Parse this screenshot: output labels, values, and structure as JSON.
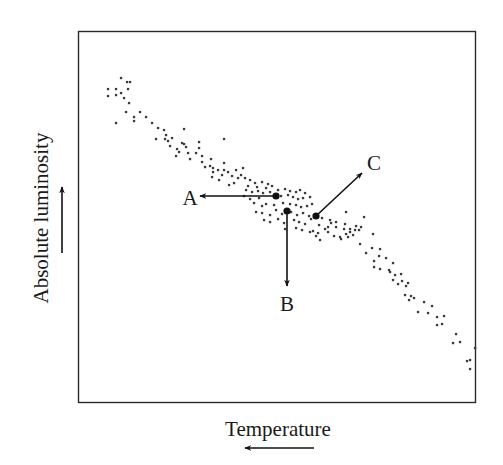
{
  "chart_data": {
    "type": "scatter",
    "title": "",
    "xlabel": "Temperature",
    "ylabel": "Absolute luminosity",
    "x_axis_direction": "decreasing to the right (arrow points left = increasing temperature)",
    "y_axis_direction": "increasing upward",
    "grid": false,
    "legend": null,
    "ticks": {
      "x": [],
      "y": []
    },
    "frame": {
      "left": 78,
      "top": 31,
      "right": 476,
      "bottom": 403
    },
    "colors": {
      "points": "#3a3a3a",
      "frame": "#2a2a2a",
      "arrows": "#111111",
      "text": "#1a1a1a"
    },
    "annotations": [
      {
        "label": "A",
        "from": [
          276,
          196
        ],
        "to": [
          200,
          196
        ],
        "label_pos": [
          190,
          205
        ],
        "direction": "left"
      },
      {
        "label": "B",
        "from": [
          287,
          211
        ],
        "to": [
          287,
          286
        ],
        "label_pos": [
          287,
          311
        ],
        "direction": "down"
      },
      {
        "label": "C",
        "from": [
          316,
          216
        ],
        "to": [
          362,
          173
        ],
        "label_pos": [
          374,
          170
        ],
        "direction": "up-right"
      }
    ],
    "points": [
      [
        121,
        78
      ],
      [
        127,
        82
      ],
      [
        130,
        82
      ],
      [
        108,
        89
      ],
      [
        116,
        89
      ],
      [
        128,
        89
      ],
      [
        108,
        96
      ],
      [
        116,
        95
      ],
      [
        121,
        93
      ],
      [
        124,
        98
      ],
      [
        129,
        103
      ],
      [
        126,
        112
      ],
      [
        140,
        112
      ],
      [
        134,
        117
      ],
      [
        134,
        121
      ],
      [
        146,
        117
      ],
      [
        116,
        123
      ],
      [
        152,
        123
      ],
      [
        158,
        128
      ],
      [
        164,
        130
      ],
      [
        166,
        135
      ],
      [
        165,
        139
      ],
      [
        156,
        139
      ],
      [
        184,
        129
      ],
      [
        170,
        146
      ],
      [
        168,
        141
      ],
      [
        172,
        138
      ],
      [
        177,
        149
      ],
      [
        182,
        143
      ],
      [
        179,
        152
      ],
      [
        184,
        144
      ],
      [
        176,
        156
      ],
      [
        186,
        147
      ],
      [
        188,
        153
      ],
      [
        199,
        142
      ],
      [
        190,
        159
      ],
      [
        202,
        156
      ],
      [
        199,
        148
      ],
      [
        202,
        162
      ],
      [
        196,
        153
      ],
      [
        211,
        159
      ],
      [
        210,
        166
      ],
      [
        213,
        172
      ],
      [
        218,
        170
      ],
      [
        224,
        163
      ],
      [
        213,
        168
      ],
      [
        212,
        177
      ],
      [
        222,
        175
      ],
      [
        224,
        170
      ],
      [
        224,
        139
      ],
      [
        205,
        167
      ],
      [
        219,
        180
      ],
      [
        228,
        172
      ],
      [
        232,
        176
      ],
      [
        236,
        170
      ],
      [
        238,
        178
      ],
      [
        234,
        183
      ],
      [
        229,
        185
      ],
      [
        241,
        175
      ],
      [
        243,
        168
      ],
      [
        245,
        178
      ],
      [
        250,
        180
      ],
      [
        255,
        183
      ],
      [
        262,
        182
      ],
      [
        268,
        184
      ],
      [
        272,
        186
      ],
      [
        278,
        190
      ],
      [
        285,
        189
      ],
      [
        290,
        191
      ],
      [
        296,
        192
      ],
      [
        300,
        190
      ],
      [
        305,
        193
      ],
      [
        246,
        190
      ],
      [
        252,
        192
      ],
      [
        258,
        191
      ],
      [
        263,
        193
      ],
      [
        270,
        192
      ],
      [
        281,
        196
      ],
      [
        288,
        195
      ],
      [
        293,
        197
      ],
      [
        298,
        199
      ],
      [
        303,
        198
      ],
      [
        310,
        197
      ],
      [
        254,
        203
      ],
      [
        262,
        206
      ],
      [
        266,
        204
      ],
      [
        274,
        205
      ],
      [
        283,
        203
      ],
      [
        290,
        204
      ],
      [
        296,
        205
      ],
      [
        301,
        207
      ],
      [
        307,
        206
      ],
      [
        312,
        204
      ],
      [
        256,
        212
      ],
      [
        262,
        213
      ],
      [
        270,
        215
      ],
      [
        276,
        210
      ],
      [
        282,
        214
      ],
      [
        291,
        212
      ],
      [
        297,
        215
      ],
      [
        303,
        213
      ],
      [
        309,
        216
      ],
      [
        264,
        220
      ],
      [
        270,
        222
      ],
      [
        278,
        219
      ],
      [
        284,
        223
      ],
      [
        294,
        220
      ],
      [
        299,
        222
      ],
      [
        305,
        224
      ],
      [
        311,
        219
      ],
      [
        285,
        229
      ],
      [
        296,
        228
      ],
      [
        302,
        230
      ],
      [
        310,
        232
      ],
      [
        248,
        186
      ],
      [
        257,
        187
      ],
      [
        266,
        188
      ],
      [
        244,
        196
      ],
      [
        250,
        199
      ],
      [
        259,
        198
      ],
      [
        346,
        212
      ],
      [
        330,
        220
      ],
      [
        364,
        217
      ],
      [
        331,
        223
      ],
      [
        336,
        222
      ],
      [
        345,
        224
      ],
      [
        328,
        227
      ],
      [
        336,
        227
      ],
      [
        344,
        229
      ],
      [
        350,
        229
      ],
      [
        356,
        226
      ],
      [
        361,
        227
      ],
      [
        313,
        231
      ],
      [
        318,
        233
      ],
      [
        328,
        232
      ],
      [
        334,
        236
      ],
      [
        340,
        237
      ],
      [
        346,
        234
      ],
      [
        350,
        232
      ],
      [
        355,
        230
      ],
      [
        359,
        230
      ],
      [
        341,
        239
      ],
      [
        348,
        237
      ],
      [
        353,
        235
      ],
      [
        373,
        234
      ],
      [
        360,
        244
      ],
      [
        366,
        253
      ],
      [
        372,
        248
      ],
      [
        380,
        249
      ],
      [
        379,
        256
      ],
      [
        374,
        261
      ],
      [
        386,
        258
      ],
      [
        374,
        267
      ],
      [
        380,
        269
      ],
      [
        389,
        270
      ],
      [
        393,
        263
      ],
      [
        390,
        272
      ],
      [
        395,
        275
      ],
      [
        401,
        274
      ],
      [
        393,
        280
      ],
      [
        398,
        284
      ],
      [
        402,
        281
      ],
      [
        406,
        286
      ],
      [
        408,
        283
      ],
      [
        405,
        295
      ],
      [
        411,
        296
      ],
      [
        409,
        300
      ],
      [
        414,
        298
      ],
      [
        424,
        302
      ],
      [
        432,
        306
      ],
      [
        418,
        312
      ],
      [
        428,
        313
      ],
      [
        437,
        317
      ],
      [
        437,
        325
      ],
      [
        442,
        324
      ],
      [
        444,
        316
      ],
      [
        456,
        334
      ],
      [
        453,
        343
      ],
      [
        460,
        342
      ],
      [
        475,
        348
      ],
      [
        470,
        360
      ],
      [
        467,
        361
      ],
      [
        470,
        369
      ],
      [
        322,
        218
      ],
      [
        319,
        225
      ],
      [
        325,
        229
      ],
      [
        316,
        236
      ],
      [
        320,
        240
      ]
    ]
  },
  "labels": {
    "x_axis": "Temperature",
    "y_axis": "Absolute luminosity",
    "point_a": "A",
    "point_b": "B",
    "point_c": "C"
  }
}
